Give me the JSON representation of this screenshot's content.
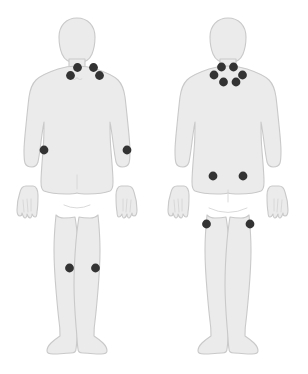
{
  "diagram": {
    "marker_color": "#333333",
    "body_fill_color": "#ebebeb",
    "body_outline_color": "#c9c9c9",
    "background_color": "#ffffff",
    "marker_radius": 4.4
  },
  "figures": [
    {
      "id": "front",
      "view_label": "Front view",
      "marker_count": 8,
      "markers": [
        {
          "label": "neck-front-left-upper",
          "x": 77.5,
          "y": 67.5
        },
        {
          "label": "neck-front-right-upper",
          "x": 93.5,
          "y": 67.5
        },
        {
          "label": "neck-front-left-lower",
          "x": 70.5,
          "y": 75.5
        },
        {
          "label": "neck-front-right-lower",
          "x": 99.5,
          "y": 75.5
        },
        {
          "label": "elbow-front-left",
          "x": 44.0,
          "y": 150.0
        },
        {
          "label": "elbow-front-right",
          "x": 127.0,
          "y": 150.0
        },
        {
          "label": "knee-front-left",
          "x": 69.5,
          "y": 268.0
        },
        {
          "label": "knee-front-right",
          "x": 95.5,
          "y": 268.0
        }
      ]
    },
    {
      "id": "back",
      "view_label": "Back view",
      "marker_count": 10,
      "markers": [
        {
          "label": "neck-back-left-upper",
          "x": 67.5,
          "y": 67.0
        },
        {
          "label": "neck-back-right-upper",
          "x": 79.5,
          "y": 67.0
        },
        {
          "label": "neck-back-far-left",
          "x": 60.0,
          "y": 75.0
        },
        {
          "label": "neck-back-far-right",
          "x": 88.5,
          "y": 75.0
        },
        {
          "label": "neck-back-left-lower",
          "x": 69.5,
          "y": 82.0
        },
        {
          "label": "neck-back-right-lower",
          "x": 82.0,
          "y": 82.0
        },
        {
          "label": "lower-back-left",
          "x": 59.0,
          "y": 176.0
        },
        {
          "label": "lower-back-right",
          "x": 89.0,
          "y": 176.0
        },
        {
          "label": "thigh-back-left",
          "x": 52.5,
          "y": 224.0
        },
        {
          "label": "thigh-back-right",
          "x": 96.0,
          "y": 224.0
        }
      ]
    }
  ]
}
